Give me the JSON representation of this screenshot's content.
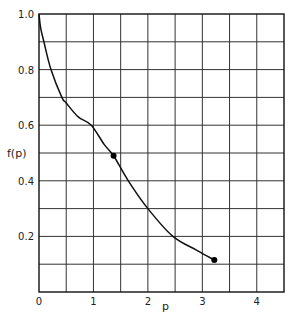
{
  "chart_data": {
    "type": "line",
    "title": "",
    "xlabel": "p",
    "ylabel": "f(p)",
    "xlim": [
      0,
      4.5
    ],
    "ylim": [
      0,
      1.0
    ],
    "grid": true,
    "grid_x_step": 0.5,
    "grid_y_step": 0.1,
    "x_ticks": [
      0,
      1,
      2,
      3,
      4
    ],
    "x_tick_labels": [
      "0",
      "1",
      "2",
      "3",
      "4"
    ],
    "y_ticks": [
      0.2,
      0.4,
      0.6,
      0.8,
      1.0
    ],
    "y_tick_labels": [
      "0.2",
      "0.4",
      "0.6",
      "0.8",
      "1.0"
    ],
    "series": [
      {
        "name": "f(p)",
        "x": [
          0,
          0.03,
          0.09,
          0.22,
          0.42,
          0.5,
          0.72,
          0.96,
          1.2,
          1.37,
          1.64,
          2.0,
          2.46,
          2.9,
          3.22
        ],
        "values": [
          1.0,
          0.95,
          0.9,
          0.8,
          0.7,
          0.68,
          0.63,
          0.6,
          0.53,
          0.49,
          0.4,
          0.3,
          0.2,
          0.15,
          0.115
        ]
      }
    ],
    "markers": [
      {
        "x": 1.37,
        "y": 0.49
      },
      {
        "x": 3.22,
        "y": 0.115
      }
    ],
    "legend": null
  }
}
